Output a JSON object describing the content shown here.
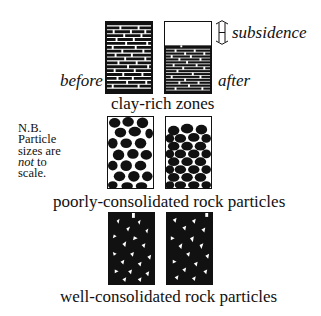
{
  "figure": {
    "labels": {
      "before": "before",
      "after": "after",
      "subsidence": "subsidence"
    },
    "note": {
      "lines": [
        "N.B.",
        "Particle",
        "sizes are",
        "not",
        "to",
        "scale."
      ]
    },
    "rows": [
      {
        "id": "clay-rich",
        "caption": "clay-rich zones",
        "before_fill": "brick-layers",
        "after_fill": "compressed-brick-layers",
        "after_subsidence_gap_fraction": 0.33
      },
      {
        "id": "poorly-consolidated",
        "caption": "poorly-consolidated rock particles",
        "before_fill": "loose-rounded-particles",
        "after_fill": "packed-rounded-particles",
        "after_subsidence_gap_fraction": 0.1
      },
      {
        "id": "well-consolidated",
        "caption": "well-consolidated rock particles",
        "before_fill": "tightly-packed-particles",
        "after_fill": "tightly-packed-particles",
        "after_subsidence_gap_fraction": 0
      }
    ],
    "colors": {
      "ink": "#111111",
      "paper": "#ffffff"
    }
  }
}
